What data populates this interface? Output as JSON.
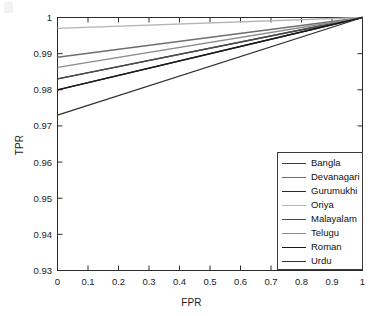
{
  "chart_data": {
    "type": "line",
    "title": "",
    "xlabel": "FPR",
    "ylabel": "TPR",
    "xlim": [
      0,
      1
    ],
    "ylim": [
      0.93,
      1
    ],
    "grid": false,
    "legend_position": "lower right",
    "xticks": [
      "0",
      "0.1",
      "0.2",
      "0.3",
      "0.4",
      "0.5",
      "0.6",
      "0.7",
      "0.8",
      "0.9",
      "1"
    ],
    "xtick_values": [
      0,
      0.1,
      0.2,
      0.3,
      0.4,
      0.5,
      0.6,
      0.7,
      0.8,
      0.9,
      1
    ],
    "yticks": [
      "0.93",
      "0.94",
      "0.95",
      "0.96",
      "0.97",
      "0.98",
      "0.99",
      "1"
    ],
    "ytick_values": [
      0.93,
      0.94,
      0.95,
      0.96,
      0.97,
      0.98,
      0.99,
      1
    ],
    "x": [
      0,
      1
    ],
    "series": [
      {
        "name": "Bangla",
        "values": [
          0.983,
          1.0
        ],
        "color": "#3c3c3c"
      },
      {
        "name": "Devanagari",
        "values": [
          0.989,
          1.0
        ],
        "color": "#6e6e6e"
      },
      {
        "name": "Gurumukhi",
        "values": [
          0.98,
          1.0
        ],
        "color": "#2a2a2a"
      },
      {
        "name": "Oriya",
        "values": [
          0.997,
          1.0
        ],
        "color": "#b4b4b4"
      },
      {
        "name": "Malayalam",
        "values": [
          0.983,
          1.0
        ],
        "color": "#4a4a4a"
      },
      {
        "name": "Telugu",
        "values": [
          0.9862,
          1.0
        ],
        "color": "#8c8c8c"
      },
      {
        "name": "Roman",
        "values": [
          0.98,
          1.0
        ],
        "color": "#181818"
      },
      {
        "name": "Urdu",
        "values": [
          0.973,
          1.0
        ],
        "color": "#303030"
      }
    ]
  },
  "legend": {
    "items": [
      {
        "label": "Bangla"
      },
      {
        "label": "Devanagari"
      },
      {
        "label": "Gurumukhi"
      },
      {
        "label": "Oriya"
      },
      {
        "label": "Malayalam"
      },
      {
        "label": "Telugu"
      },
      {
        "label": "Roman"
      },
      {
        "label": "Urdu"
      }
    ]
  },
  "axes": {
    "frame_color": "#2b2b2b"
  }
}
